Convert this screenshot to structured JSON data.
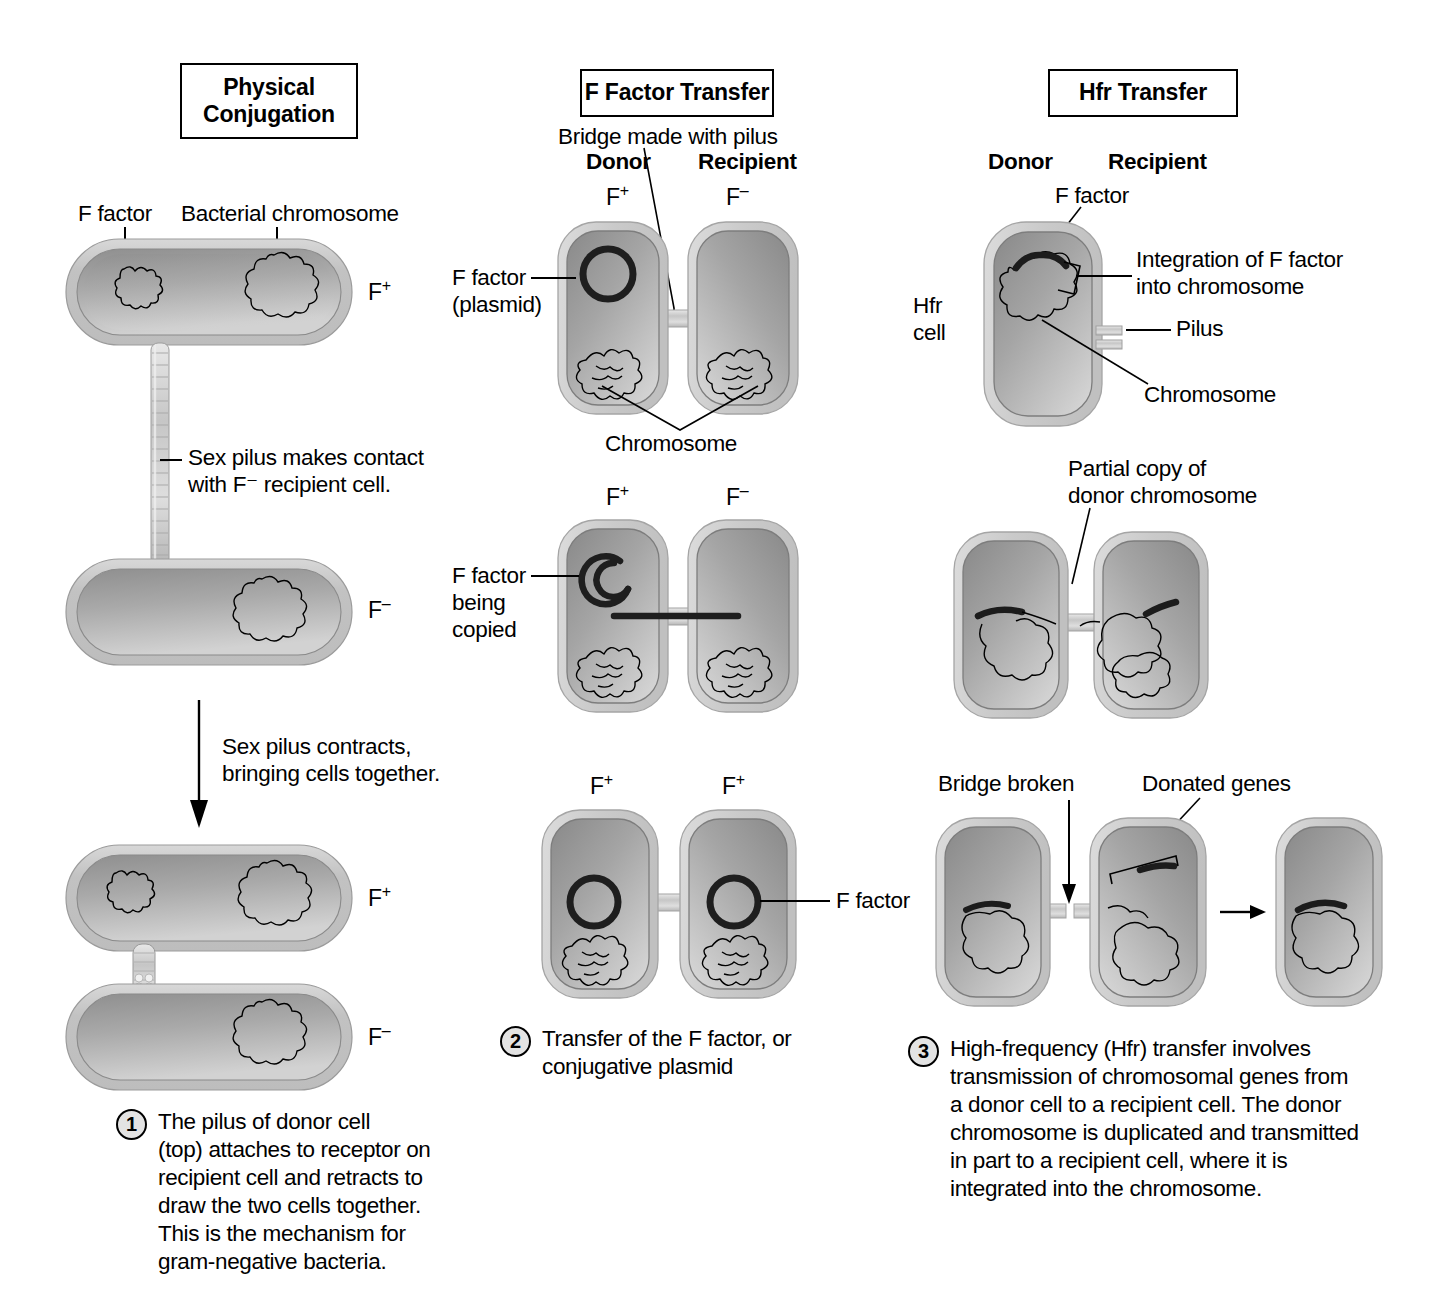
{
  "columns": {
    "left": {
      "title": "Physical\nConjugation",
      "labels": {
        "f_factor": "F factor",
        "bacterial_chromosome": "Bacterial chromosome",
        "cell1_state": "F",
        "cell1_sign": "+",
        "cell2_state": "F",
        "cell2_sign": "–",
        "cell3_state": "F",
        "cell3_sign": "+",
        "cell4_state": "F",
        "cell4_sign": "–",
        "note_pilus_contact": "Sex pilus makes contact\nwith F⁻ recipient cell.",
        "note_pilus_contracts": "Sex pilus contracts,\nbringing cells together."
      },
      "caption": {
        "number": "1",
        "text": "The pilus of donor cell\n(top) attaches to receptor on\nrecipient cell and retracts to\ndraw the two cells together.\nThis is the mechanism for\ngram-negative bacteria."
      }
    },
    "middle": {
      "title": "F Factor Transfer",
      "labels": {
        "bridge": "Bridge made with pilus",
        "donor": "Donor",
        "recipient": "Recipient",
        "f_factor_plasmid": "F factor\n(plasmid)",
        "chromosome": "Chromosome",
        "f_factor_being_copied": "F factor\nbeing\ncopied",
        "f_factor": "F factor",
        "row1_left": "F",
        "row1_left_sign": "+",
        "row1_right": "F",
        "row1_right_sign": "–",
        "row2_left": "F",
        "row2_left_sign": "+",
        "row2_right": "F",
        "row2_right_sign": "–",
        "row3_left": "F",
        "row3_left_sign": "+",
        "row3_right": "F",
        "row3_right_sign": "+"
      },
      "caption": {
        "number": "2",
        "text": "Transfer of the F factor, or\nconjugative plasmid"
      }
    },
    "right": {
      "title": "Hfr Transfer",
      "labels": {
        "donor": "Donor",
        "recipient": "Recipient",
        "f_factor": "F factor",
        "integration": "Integration of F factor\ninto chromosome",
        "pilus": "Pilus",
        "chromosome": "Chromosome",
        "hfr_cell": "Hfr\ncell",
        "partial_copy": "Partial copy of\ndonor chromosome",
        "bridge_broken": "Bridge broken",
        "donated_genes": "Donated genes"
      },
      "caption": {
        "number": "3",
        "text": "High-frequency (Hfr) transfer involves\ntransmission of chromosomal genes from\na donor cell to a recipient cell. The donor\nchromosome is duplicated and transmitted\nin part to a recipient cell, where it is\nintegrated into the chromosome."
      }
    }
  },
  "colors": {
    "ink": "#000000",
    "cell_outer": "#cfcfcf",
    "cell_inner": "#9a9a9a",
    "cell_light": "#e6e6e6",
    "chromosome_stroke": "#4a4a4a",
    "plasmid_dark": "#1a1a1a",
    "background": "#ffffff"
  }
}
